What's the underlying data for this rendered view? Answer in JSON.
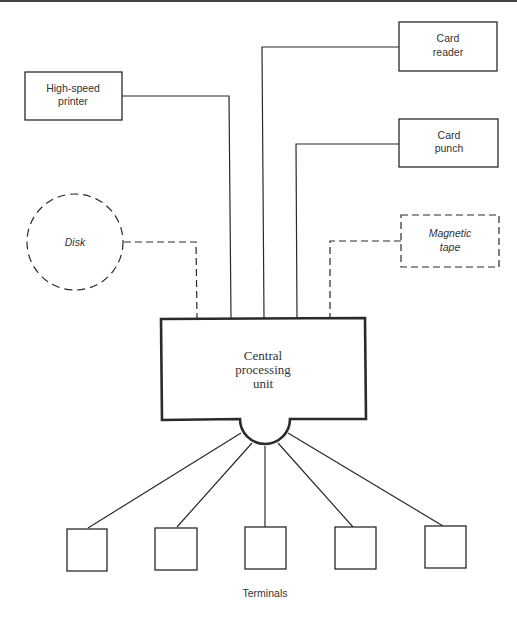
{
  "diagram": {
    "devices": {
      "printer": {
        "line1": "High-speed",
        "line2": "printer",
        "style": "solid"
      },
      "card_reader": {
        "line1": "Card",
        "line2": "reader",
        "style": "solid"
      },
      "card_punch": {
        "line1": "Card",
        "line2": "punch",
        "style": "solid"
      },
      "disk": {
        "label": "Disk",
        "style": "dashed"
      },
      "magnetic_tape": {
        "line1": "Magnetic",
        "line2": "tape",
        "style": "dashed"
      }
    },
    "cpu": {
      "line1": "Central",
      "line2": "processing",
      "line3": "unit"
    },
    "terminals": {
      "label": "Terminals",
      "count": 5
    },
    "colors": {
      "stroke": "#2a2a2a",
      "text": "#333333",
      "background": "#ffffff"
    }
  }
}
